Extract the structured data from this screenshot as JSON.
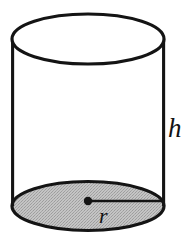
{
  "figure": {
    "kind": "right-circular-cylinder",
    "background_color": "#ffffff",
    "stroke_color": "#141414",
    "base_fill_color": "#b9b9b9",
    "labels": {
      "height": "h",
      "radius": "r"
    },
    "geometry": {
      "center_x": 88,
      "radius_x": 76,
      "top_ellipse_center_y": 39,
      "bottom_ellipse_center_y": 206,
      "ellipse_radius_y": 25,
      "left_wall_x": 12,
      "right_wall_x": 164,
      "center_dot_x": 88,
      "center_dot_y": 201,
      "radius_line_end_x": 163,
      "stroke_width": 3.2,
      "center_dot_radius": 4.2
    },
    "parts": [
      {
        "name": "top-ellipse",
        "fill": "none"
      },
      {
        "name": "bottom-ellipse",
        "fill": "#b9b9b9"
      },
      {
        "name": "left-wall",
        "fill": "none"
      },
      {
        "name": "right-wall",
        "fill": "none"
      },
      {
        "name": "radius-segment",
        "fill": "none"
      },
      {
        "name": "center-dot",
        "fill": "#141414"
      }
    ]
  }
}
